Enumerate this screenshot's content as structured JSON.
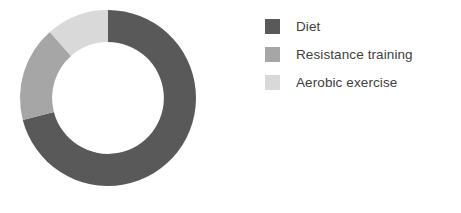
{
  "chart_data": {
    "type": "pie",
    "variant": "donut",
    "title": "",
    "subtitle": "",
    "xlabel": "",
    "ylabel": "",
    "legend_position": "right",
    "grid": false,
    "start_angle_deg": 0,
    "direction": "clockwise",
    "inner_radius_ratio": 0.635,
    "categories": [
      "Diet",
      "Resistance training",
      "Aerobic exercise"
    ],
    "values": [
      71,
      17.5,
      11.5
    ],
    "units": "percent",
    "slices": [
      {
        "label": "Diet",
        "value": 71,
        "percent": 71,
        "start_angle_deg": 0,
        "end_angle_deg": 255.6,
        "sweep_deg": 255.6,
        "color": "#595959"
      },
      {
        "label": "Resistance training",
        "value": 17.5,
        "percent": 17.5,
        "start_angle_deg": 255.6,
        "end_angle_deg": 318.6,
        "sweep_deg": 63,
        "color": "#a6a6a6"
      },
      {
        "label": "Aerobic exercise",
        "value": 11.5,
        "percent": 11.5,
        "start_angle_deg": 318.6,
        "end_angle_deg": 360,
        "sweep_deg": 41.4,
        "color": "#d9d9d9"
      }
    ]
  },
  "legend": {
    "items": [
      {
        "label": "Diet",
        "color": "#595959"
      },
      {
        "label": "Resistance training",
        "color": "#a6a6a6"
      },
      {
        "label": "Aerobic exercise",
        "color": "#d9d9d9"
      }
    ]
  },
  "canvas": {
    "background": "#ffffff",
    "text_color": "#404040"
  }
}
